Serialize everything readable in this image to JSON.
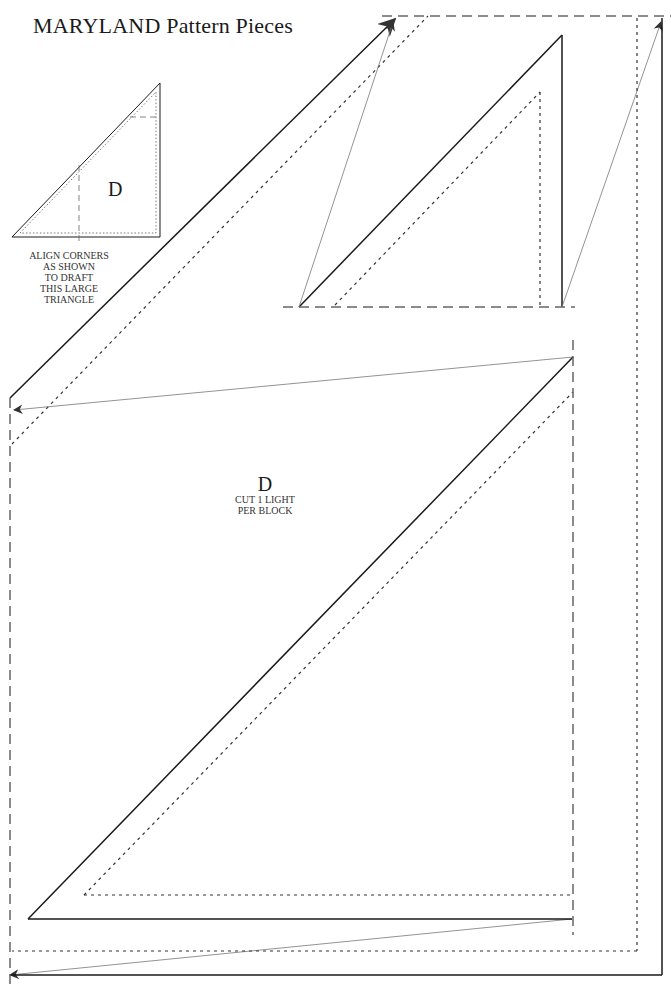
{
  "page": {
    "title": "MARYLAND Pattern Pieces"
  },
  "thumbnail": {
    "piece_label": "D",
    "note_lines": [
      "ALIGN CORNERS",
      "AS SHOWN",
      "TO DRAFT",
      "THIS LARGE",
      "TRIANGLE"
    ]
  },
  "main_piece": {
    "piece_label": "D",
    "instruction_lines": [
      "CUT 1 LIGHT",
      "PER BLOCK"
    ]
  },
  "colors": {
    "line": "#1a1a1a",
    "dashed": "#555555",
    "arrow": "#777777",
    "arrowhead": "#333333",
    "background": "#ffffff"
  }
}
